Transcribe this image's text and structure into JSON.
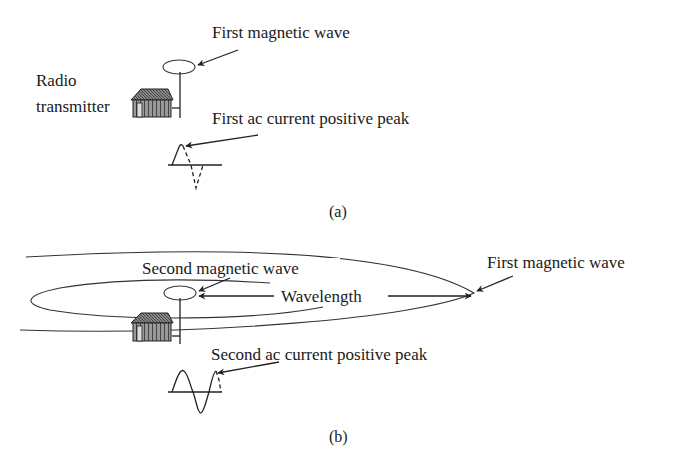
{
  "panel_a": {
    "caption": "(a)",
    "labels": {
      "transmitter_line1": "Radio",
      "transmitter_line2": "transmitter",
      "magnetic_wave": "First magnetic wave",
      "current_peak": "First ac current positive peak"
    }
  },
  "panel_b": {
    "caption": "(b)",
    "labels": {
      "second_magnetic_wave": "Second magnetic wave",
      "wavelength": "Wavelength",
      "first_magnetic_wave": "First magnetic wave",
      "current_peak": "Second ac current positive peak"
    }
  },
  "colors": {
    "line": "#222222",
    "text": "#1a1a1a",
    "background": "#ffffff"
  }
}
